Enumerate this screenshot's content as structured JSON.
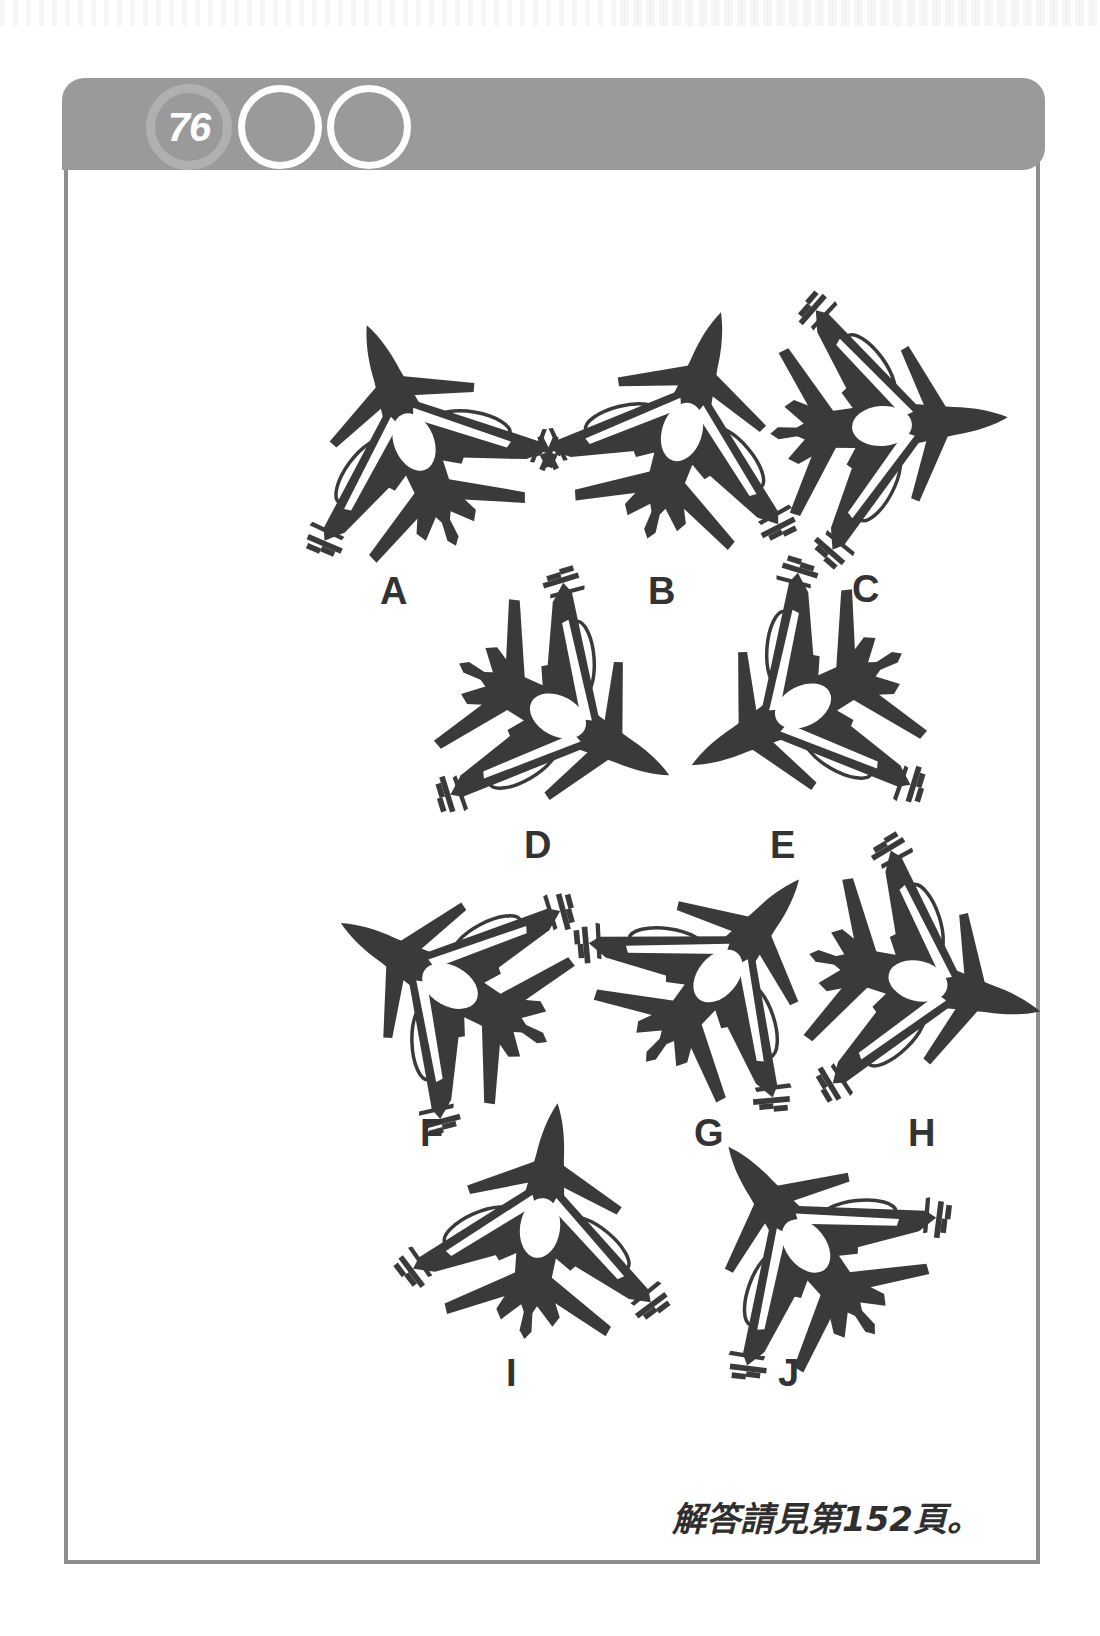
{
  "page": {
    "number": "76",
    "header_circles": [
      "76",
      "",
      ""
    ],
    "frame_border_color": "#8e8e8e",
    "header_bar_color": "#9a9a9a",
    "jet_color": "#3a3a3a",
    "label_color": "#333333"
  },
  "puzzle": {
    "type": "rotated-silhouette-matching",
    "subject": "fighter-jet",
    "items": [
      {
        "label": "A",
        "rotation": -22,
        "x": 196,
        "y": 196
      },
      {
        "label": "B",
        "rotation": 18,
        "x": 464,
        "y": 186
      },
      {
        "label": "C",
        "rotation": 86,
        "x": 664,
        "y": 180
      },
      {
        "label": "D",
        "rotation": 118,
        "x": 340,
        "y": 470
      },
      {
        "label": "E",
        "rotation": -118,
        "x": 585,
        "y": 460
      },
      {
        "label": "F",
        "rotation": -60,
        "x": 232,
        "y": 740
      },
      {
        "label": "G",
        "rotation": 40,
        "x": 500,
        "y": 730
      },
      {
        "label": "H",
        "rotation": 104,
        "x": 700,
        "y": 735
      },
      {
        "label": "I",
        "rotation": 8,
        "x": 322,
        "y": 982
      },
      {
        "label": "J",
        "rotation": -38,
        "x": 588,
        "y": 1000
      }
    ],
    "labels": [
      {
        "text": "A",
        "x": 312,
        "y": 476
      },
      {
        "text": "B",
        "x": 580,
        "y": 476
      },
      {
        "text": "C",
        "x": 784,
        "y": 474
      },
      {
        "text": "D",
        "x": 456,
        "y": 730
      },
      {
        "text": "E",
        "x": 702,
        "y": 730
      },
      {
        "text": "F",
        "x": 352,
        "y": 1018
      },
      {
        "text": "G",
        "x": 626,
        "y": 1018
      },
      {
        "text": "H",
        "x": 840,
        "y": 1018
      },
      {
        "text": "I",
        "x": 438,
        "y": 1258
      },
      {
        "text": "J",
        "x": 710,
        "y": 1258
      }
    ]
  },
  "footer": {
    "answer_note": "解答請見第152頁。"
  }
}
